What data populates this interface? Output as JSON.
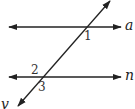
{
  "figure": {
    "stroke_color": "#222222",
    "background": "#ffffff"
  },
  "lines": {
    "a": {
      "label": "a",
      "y": 27,
      "x1": 8,
      "x2": 122
    },
    "n": {
      "label": "n",
      "y": 77,
      "x1": 8,
      "x2": 122
    },
    "v": {
      "label": "v",
      "x1": 110,
      "y1": 1,
      "x2": 17,
      "y2": 106
    }
  },
  "angles": {
    "one": {
      "label": "1",
      "at_line": "a"
    },
    "two": {
      "label": "2",
      "at_line": "n"
    },
    "three": {
      "label": "3",
      "at_line": "n"
    }
  }
}
